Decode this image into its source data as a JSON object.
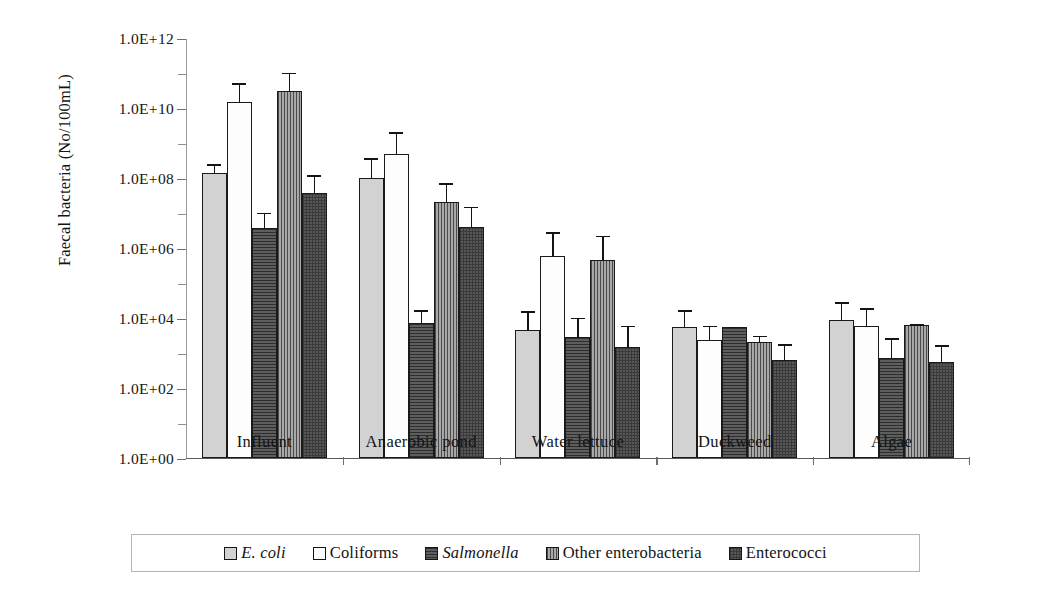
{
  "chart_data": {
    "type": "bar",
    "title": "",
    "subtitle": "",
    "xlabel": "",
    "ylabel": "Faecal bacteria (No/100mL)",
    "scale": "log10",
    "ylim": [
      1,
      1000000000000
    ],
    "grid": false,
    "orientation": "vertical",
    "grouping": "grouped",
    "error_bars": "upper only (standard deviation caps)",
    "legend_position": "bottom",
    "ytick_labels": [
      "1.0E+12",
      "1.0E+10",
      "1.0E+08",
      "1.0E+06",
      "1.0E+04",
      "1.0E+02",
      "1.0E+00"
    ],
    "ytick_values": [
      1000000000000,
      10000000000,
      100000000,
      1000000,
      10000,
      100,
      1
    ],
    "categories": [
      "Influent",
      "Anaerobic pond",
      "Water lettuce",
      "Duckweed",
      "Algae"
    ],
    "series": [
      {
        "name": "E. coli",
        "italic": true,
        "pattern": "solid-light-gray",
        "color": "#d2d2d2",
        "values": [
          140000000.0,
          100000000.0,
          4500.0,
          5500.0,
          8500.0
        ],
        "errors_upper": [
          260000000.0,
          400000000.0,
          17000.0,
          18000.0,
          30000.0
        ]
      },
      {
        "name": "Coliforms",
        "italic": false,
        "pattern": "solid-white",
        "color": "#fdfdfd",
        "values": [
          15000000000.0,
          500000000.0,
          600000.0,
          2400.0,
          6000.0
        ],
        "errors_upper": [
          55000000000.0,
          2200000000.0,
          3000000.0,
          6500.0,
          20000.0
        ]
      },
      {
        "name": "Salmonella",
        "italic": true,
        "pattern": "horizontal-lines-dark",
        "color": "#4c4c4c",
        "values": [
          3800000.0,
          7000.0,
          2800.0,
          5500.0,
          700.0
        ],
        "errors_upper": [
          11000000.0,
          18000.0,
          11000.0,
          6000.0,
          2800.0
        ]
      },
      {
        "name": "Other enterobacteria",
        "italic": false,
        "pattern": "vertical-lines-gray",
        "color": "#8f8f8f",
        "values": [
          30000000000.0,
          20000000.0,
          450000.0,
          2000.0,
          6500.0
        ],
        "errors_upper": [
          110000000000.0,
          75000000.0,
          2400000.0,
          3300.0,
          7000.0
        ]
      },
      {
        "name": "Enterococci",
        "italic": false,
        "pattern": "checkered-dark-gray",
        "color": "#585858",
        "values": [
          38000000.0,
          4000000.0,
          1500.0,
          650.0,
          550.0
        ],
        "errors_upper": [
          130000000.0,
          16000000.0,
          6500.0,
          1900.0,
          1800.0
        ]
      }
    ]
  },
  "legend": {
    "items": [
      {
        "label": "E. coli",
        "italic": true,
        "swatch": "series-0-swatch"
      },
      {
        "label": "Coliforms",
        "italic": false,
        "swatch": "series-1-swatch"
      },
      {
        "label": "Salmonella",
        "italic": true,
        "swatch": "series-2-swatch"
      },
      {
        "label": "Other enterobacteria",
        "italic": false,
        "swatch": "series-3-swatch"
      },
      {
        "label": "Enterococci",
        "italic": false,
        "swatch": "series-4-swatch"
      }
    ]
  }
}
